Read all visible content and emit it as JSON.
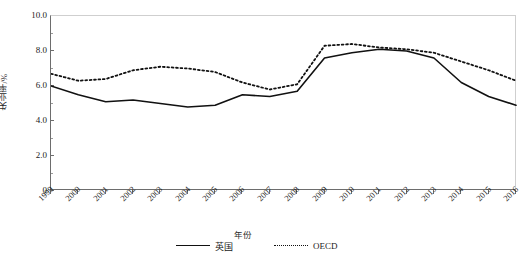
{
  "chart_data": {
    "type": "line",
    "title": "",
    "xlabel": "年份",
    "ylabel": "失业率/%",
    "x": [
      1999,
      2000,
      2001,
      2002,
      2003,
      2004,
      2005,
      2006,
      2007,
      2008,
      2009,
      2010,
      2011,
      2012,
      2013,
      2014,
      2015,
      2016
    ],
    "categories": [
      "1999",
      "2000",
      "2001",
      "2002",
      "2003",
      "2004",
      "2005",
      "2006",
      "2007",
      "2008",
      "2009",
      "2010",
      "2011",
      "2012",
      "2013",
      "2014",
      "2015",
      "2016"
    ],
    "series": [
      {
        "name": "英国",
        "style": "solid",
        "color": "#111111",
        "values": [
          6.0,
          5.5,
          5.1,
          5.2,
          5.0,
          4.8,
          4.9,
          5.5,
          5.4,
          5.7,
          7.6,
          7.9,
          8.1,
          8.0,
          7.6,
          6.2,
          5.4,
          4.9
        ]
      },
      {
        "name": "OECD",
        "style": "dotted",
        "color": "#111111",
        "values": [
          6.7,
          6.3,
          6.4,
          6.9,
          7.1,
          7.0,
          6.8,
          6.2,
          5.8,
          6.1,
          8.3,
          8.4,
          8.2,
          8.1,
          7.9,
          7.4,
          6.9,
          6.3
        ]
      }
    ],
    "yticks": [
      "0",
      "2.0",
      "4.0",
      "6.0",
      "8.0",
      "10.0"
    ],
    "ytick_values": [
      0,
      2.0,
      4.0,
      6.0,
      8.0,
      10.0
    ],
    "yminor_values": [
      1.0,
      3.0,
      5.0,
      7.0,
      9.0
    ],
    "ylim": [
      0,
      10
    ],
    "xlim": [
      1999,
      2016
    ],
    "grid": false,
    "legend_position": "bottom-center"
  },
  "legend": {
    "entries": [
      {
        "label": "英国",
        "style": "solid"
      },
      {
        "label": "OECD",
        "style": "dotted"
      }
    ]
  },
  "axes": {
    "y_title": "失业率/%",
    "x_title": "年份"
  }
}
